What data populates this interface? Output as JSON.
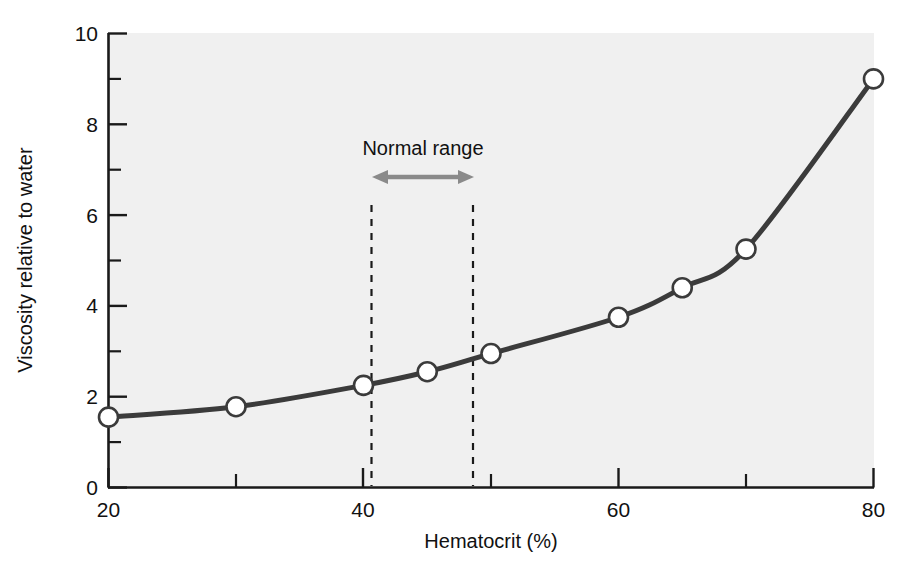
{
  "chart_data": {
    "type": "line",
    "title": "",
    "xlabel": "Hematocrit (%)",
    "ylabel": "Viscosity relative to water",
    "xlim": [
      20,
      80
    ],
    "ylim": [
      0,
      10
    ],
    "grid": false,
    "legend": null,
    "x_major_ticks": [
      20,
      40,
      60,
      80
    ],
    "x_minor_ticks": [
      30,
      50,
      70
    ],
    "y_major_ticks": [
      0,
      2,
      4,
      6,
      8,
      10
    ],
    "y_minor_ticks": [
      1,
      3,
      5,
      7,
      9
    ],
    "x_tick_labels": [
      "20",
      "40",
      "60",
      "80"
    ],
    "y_tick_labels": [
      "0",
      "2",
      "4",
      "6",
      "8",
      "10"
    ],
    "series": [
      {
        "name": "Blood viscosity",
        "marker": "open-circle",
        "x": [
          20,
          30,
          40,
          45,
          50,
          60,
          65,
          70,
          80
        ],
        "values": [
          1.55,
          1.78,
          2.25,
          2.55,
          2.95,
          3.75,
          4.4,
          5.25,
          9.0
        ]
      }
    ],
    "annotations": [
      {
        "type": "span-arrow",
        "label": "Normal range",
        "x_start": 40,
        "x_end": 48,
        "y": 6.55,
        "label_y": 7.5,
        "guide_lines": [
          40,
          48
        ],
        "guide_style": "dashed"
      }
    ],
    "colors": {
      "curve": "#3b3b3b",
      "marker_fill": "#ffffff",
      "marker_edge": "#3b3b3b",
      "plot_background": "#f0f0f0",
      "page_background": "#ffffff",
      "axis": "#1a1a1a",
      "annotation_arrow": "#8a8a8a",
      "guide_line": "#1a1a1a",
      "text": "#111111"
    }
  },
  "axes": {
    "x_title": "Hematocrit (%)",
    "y_title": "Viscosity relative to water",
    "x_labels": [
      "20",
      "40",
      "60",
      "80"
    ],
    "y_labels": [
      "0",
      "2",
      "4",
      "6",
      "8",
      "10"
    ]
  },
  "annotation": {
    "normal_range_label": "Normal range"
  }
}
